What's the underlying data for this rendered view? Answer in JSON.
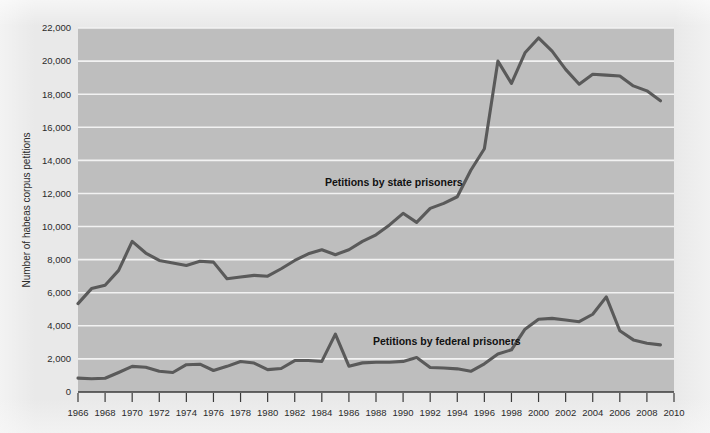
{
  "chart_data": {
    "type": "line",
    "title": "",
    "xlabel": "",
    "ylabel": "Number of habeas corpus petitions",
    "xlim": [
      1966,
      2010
    ],
    "ylim": [
      0,
      22000
    ],
    "grid": true,
    "legend_position": "inline-annotations",
    "y_ticks": [
      0,
      2000,
      4000,
      6000,
      8000,
      10000,
      12000,
      14000,
      16000,
      18000,
      20000,
      22000
    ],
    "y_tick_labels": [
      "0",
      "2,000",
      "4,000",
      "6,000",
      "8,000",
      "10,000",
      "12,000",
      "14,000",
      "16,000",
      "18,000",
      "20,000",
      "22,000"
    ],
    "x_ticks": [
      1966,
      1968,
      1970,
      1972,
      1974,
      1976,
      1978,
      1980,
      1982,
      1984,
      1986,
      1988,
      1990,
      1992,
      1994,
      1996,
      1998,
      2000,
      2002,
      2004,
      2006,
      2008,
      2010
    ],
    "x_tick_labels": [
      "1966",
      "1968",
      "1970",
      "1972",
      "1974",
      "1976",
      "1978",
      "1980",
      "1982",
      "1984",
      "1986",
      "1988",
      "1990",
      "1992",
      "1994",
      "1996",
      "1998",
      "2000",
      "2002",
      "2004",
      "2006",
      "2008",
      "2010"
    ],
    "x": [
      1966,
      1967,
      1968,
      1969,
      1970,
      1971,
      1972,
      1973,
      1974,
      1975,
      1976,
      1977,
      1978,
      1979,
      1980,
      1981,
      1982,
      1983,
      1984,
      1985,
      1986,
      1987,
      1988,
      1989,
      1990,
      1991,
      1992,
      1993,
      1994,
      1995,
      1996,
      1997,
      1998,
      1999,
      2000,
      2001,
      2002,
      2003,
      2004,
      2005,
      2006,
      2007,
      2008,
      2009
    ],
    "series": [
      {
        "name": "Petitions by state prisoners",
        "annotation": "Petitions by state prisoners",
        "color": "#5a5a5a",
        "values": [
          5340,
          6250,
          6450,
          7350,
          9100,
          8400,
          7950,
          7800,
          7650,
          7900,
          7850,
          6850,
          6950,
          7050,
          7000,
          7450,
          7950,
          8350,
          8600,
          8300,
          8600,
          9100,
          9500,
          10100,
          10800,
          10250,
          11100,
          11400,
          11800,
          13400,
          14700,
          20000,
          18650,
          20500,
          21400,
          20600,
          19500,
          18600,
          19200,
          19150,
          19100,
          18500,
          18200,
          17600
        ]
      },
      {
        "name": "Petitions by federal prisoners",
        "annotation": "Petitions by federal prisoners",
        "color": "#5a5a5a",
        "values": [
          840,
          800,
          830,
          1180,
          1550,
          1500,
          1250,
          1180,
          1650,
          1680,
          1300,
          1550,
          1840,
          1750,
          1350,
          1420,
          1900,
          1900,
          1850,
          3500,
          1560,
          1760,
          1800,
          1800,
          1850,
          2080,
          1480,
          1450,
          1400,
          1250,
          1700,
          2300,
          2550,
          3800,
          4400,
          4450,
          4350,
          4250,
          4700,
          5750,
          3700,
          3150,
          2950,
          2850
        ]
      }
    ],
    "annotations": [
      {
        "text": "Petitions by state prisoners",
        "x_px": 325,
        "y_px": 186
      },
      {
        "text": "Petitions by federal prisoners",
        "x_px": 373,
        "y_px": 345
      }
    ]
  },
  "colors": {
    "page_background": "#e9e9e9",
    "plot_background": "#bebebe",
    "gridline": "#f2f2f2",
    "line": "#5a5a5a",
    "text": "#2b2b2b"
  }
}
